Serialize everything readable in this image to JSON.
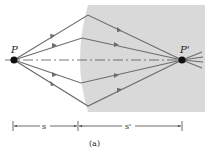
{
  "figure": {
    "caption": "(a)",
    "point_object": "P",
    "point_image": "P'",
    "distance_object": "s",
    "distance_image": "s'"
  },
  "colors": {
    "medium": "#d9d9d9",
    "ray": "#6b6b6b",
    "point": "#111111",
    "axis": "#555555"
  }
}
